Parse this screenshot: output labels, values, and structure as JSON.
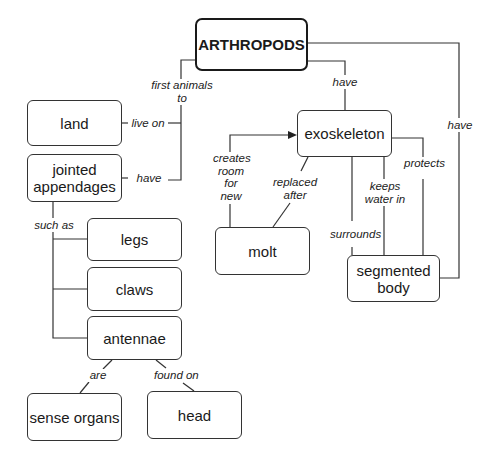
{
  "diagram": {
    "type": "concept-map",
    "root": "ARTHROPODS",
    "nodes": {
      "arthropods": "ARTHROPODS",
      "land": "land",
      "jointed_appendages_1": "jointed",
      "jointed_appendages_2": "appendages",
      "legs": "legs",
      "claws": "claws",
      "antennae": "antennae",
      "sense_organs": "sense organs",
      "head": "head",
      "exoskeleton": "exoskeleton",
      "molt": "molt",
      "segmented_body_1": "segmented",
      "segmented_body_2": "body"
    },
    "links": {
      "first_animals_to_1": "first animals",
      "first_animals_to_2": "to",
      "live_on": "live on",
      "have_appendages": "have",
      "have_exoskeleton": "have",
      "have_segmented_body": "have",
      "such_as": "such as",
      "are": "are",
      "found_on": "found on",
      "creates_room_1": "creates",
      "creates_room_2": "room",
      "creates_room_3": "for",
      "creates_room_4": "new",
      "replaced_after_1": "replaced",
      "replaced_after_2": "after",
      "surrounds": "surrounds",
      "keeps_water_in_1": "keeps",
      "keeps_water_in_2": "water in",
      "protects": "protects"
    },
    "edges": [
      {
        "from": "ARTHROPODS",
        "label": "first animals to",
        "to": "land"
      },
      {
        "from": "land",
        "label": "live on",
        "to": "ARTHROPODS"
      },
      {
        "from": "ARTHROPODS",
        "label": "have",
        "to": "jointed appendages"
      },
      {
        "from": "jointed appendages",
        "label": "such as",
        "to": [
          "legs",
          "claws",
          "antennae"
        ]
      },
      {
        "from": "antennae",
        "label": "are",
        "to": "sense organs"
      },
      {
        "from": "antennae",
        "label": "found on",
        "to": "head"
      },
      {
        "from": "ARTHROPODS",
        "label": "have",
        "to": "exoskeleton"
      },
      {
        "from": "ARTHROPODS",
        "label": "have",
        "to": "segmented body"
      },
      {
        "from": "molt",
        "label": "creates room for new",
        "to": "exoskeleton"
      },
      {
        "from": "exoskeleton",
        "label": "replaced after",
        "to": "molt"
      },
      {
        "from": "exoskeleton",
        "label": "surrounds",
        "to": "segmented body"
      },
      {
        "from": "exoskeleton",
        "label": "keeps water in",
        "to": "segmented body"
      },
      {
        "from": "exoskeleton",
        "label": "protects",
        "to": "segmented body"
      }
    ]
  }
}
